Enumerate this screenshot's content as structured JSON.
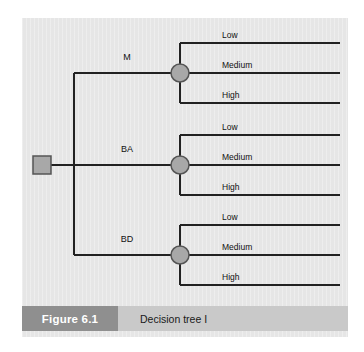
{
  "figure": {
    "caption_number": "Figure 6.1",
    "caption_title": "Decision tree I",
    "panel_bg": "#e6e6e6",
    "caption_bar_bg": "#c9c9c9",
    "caption_block_bg": "#8f8f8f",
    "line_color": "#222222",
    "node_fill": "#a8a8a8",
    "node_stroke": "#444444"
  },
  "diagram": {
    "type": "decision-tree",
    "root": {
      "name": "decision-node",
      "shape": "square",
      "x": 42,
      "y": 165
    },
    "decision_branches": [
      {
        "label": "M",
        "label_x": 127,
        "label_y": 61,
        "chance_node": {
          "x": 180,
          "y": 73
        },
        "outcomes": [
          {
            "label": "Low",
            "y": 43,
            "label_x": 222,
            "label_y": 29
          },
          {
            "label": "Medium",
            "y": 73,
            "label_x": 222,
            "label_y": 59
          },
          {
            "label": "High",
            "y": 103,
            "label_x": 222,
            "label_y": 89
          }
        ]
      },
      {
        "label": "BA",
        "label_x": 127,
        "label_y": 153,
        "chance_node": {
          "x": 180,
          "y": 165
        },
        "outcomes": [
          {
            "label": "Low",
            "y": 135,
            "label_x": 222,
            "label_y": 121
          },
          {
            "label": "Medium",
            "y": 165,
            "label_x": 222,
            "label_y": 151
          },
          {
            "label": "High",
            "y": 195,
            "label_x": 222,
            "label_y": 181
          }
        ]
      },
      {
        "label": "BD",
        "label_x": 127,
        "label_y": 243,
        "chance_node": {
          "x": 180,
          "y": 255
        },
        "outcomes": [
          {
            "label": "Low",
            "y": 225,
            "label_x": 222,
            "label_y": 211
          },
          {
            "label": "Medium",
            "y": 255,
            "label_x": 222,
            "label_y": 241
          },
          {
            "label": "High",
            "y": 285,
            "label_x": 222,
            "label_y": 271
          }
        ]
      }
    ],
    "geometry": {
      "trunk_x": 74,
      "root_stub_left": 51,
      "riser_x": 180,
      "branch_end_x": 340,
      "node_radius": 9,
      "square_size": 18
    }
  }
}
